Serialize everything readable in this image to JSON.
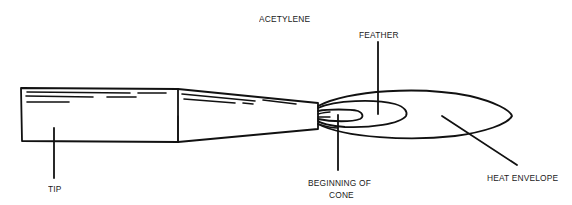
{
  "diagram": {
    "labels": {
      "acetylene": "ACETYLENE",
      "feather": "FEATHER",
      "tip": "TIP",
      "beginning_of_cone_line1": "BEGINNING OF",
      "beginning_of_cone_line2": "CONE",
      "heat_envelope": "HEAT ENVELOPE"
    },
    "parts": [
      "tip",
      "tapered-nozzle",
      "inner-cone",
      "acetylene-feather",
      "heat-envelope"
    ],
    "colors": {
      "stroke": "#111111",
      "background": "#ffffff",
      "text": "#1a1a1a"
    }
  }
}
